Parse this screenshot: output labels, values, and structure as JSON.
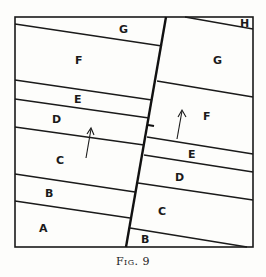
{
  "figure": {
    "caption": "Fig. 9",
    "left_block_labels": [
      "G",
      "F",
      "E",
      "D",
      "C",
      "B",
      "A"
    ],
    "right_block_labels": [
      "H",
      "G",
      "F",
      "E",
      "D",
      "C",
      "B"
    ],
    "arrows": [
      "upward arrow left block",
      "upward arrow right block"
    ]
  },
  "labels": {
    "left_G": "G",
    "left_F": "F",
    "left_E": "E",
    "left_D": "D",
    "left_C": "C",
    "left_B": "B",
    "left_A": "A",
    "right_H": "H",
    "right_G": "G",
    "right_F": "F",
    "right_E": "E",
    "right_D": "D",
    "right_C": "C",
    "right_B": "B"
  }
}
